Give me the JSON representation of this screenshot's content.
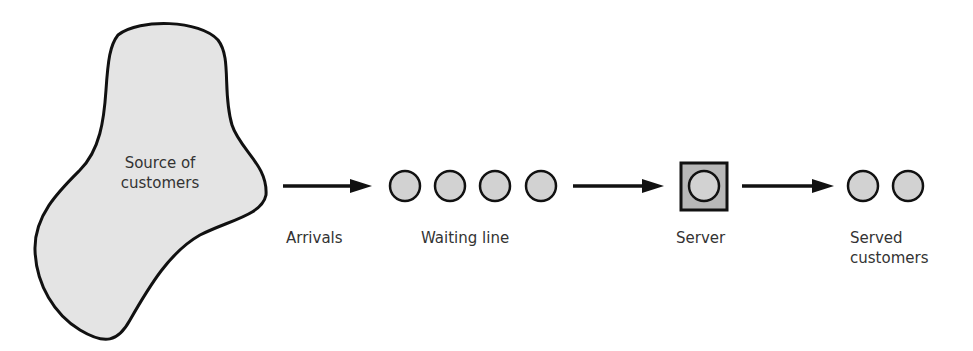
{
  "diagram": {
    "source": {
      "label_line1": "Source of",
      "label_line2": "customers"
    },
    "arrivals": {
      "label": "Arrivals"
    },
    "waiting_line": {
      "label": "Waiting line",
      "count": 4
    },
    "server": {
      "label": "Server"
    },
    "served": {
      "label_line1": "Served",
      "label_line2": "customers",
      "count": 2
    }
  },
  "colors": {
    "fill": "#d9d9d9",
    "stroke": "#111111",
    "server_fill": "#b5b5b5"
  }
}
